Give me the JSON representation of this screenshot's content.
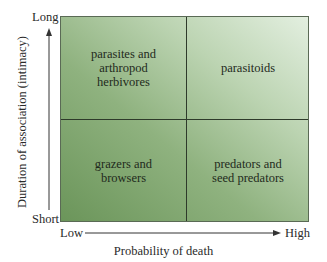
{
  "y_axis": {
    "title": "Duration of association (intimacy)",
    "top_label": "Long",
    "bottom_label": "Short"
  },
  "x_axis": {
    "title": "Probability of death",
    "left_label": "Low",
    "right_label": "High"
  },
  "quadrants": {
    "top_left": {
      "line1": "parasites and",
      "line2": "arthropod",
      "line3": "herbivores"
    },
    "top_right": {
      "line1": "parasitoids"
    },
    "bottom_left": {
      "line1": "grazers and",
      "line2": "browsers"
    },
    "bottom_right": {
      "line1": "predators and",
      "line2": "seed predators"
    }
  },
  "colors": {
    "dark_green": "#6b955a",
    "light_green": "#e3efe0",
    "lines": "#2e3a2a"
  }
}
